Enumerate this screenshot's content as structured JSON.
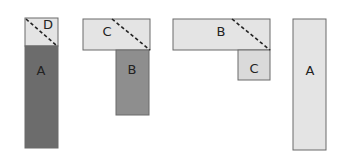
{
  "colors": {
    "light": "#e4e4e4",
    "light_c": "#dadada",
    "medium": "#8e8e8e",
    "dark": "#6c6c6c",
    "stroke": "#6a6a6a",
    "dash": "#222222"
  },
  "figures": [
    {
      "id": "fig1",
      "pieces": [
        {
          "label": "D",
          "x": 25,
          "y": 18,
          "w": 33,
          "h": 28,
          "fill": "#e4e4e4",
          "lx": 48,
          "ly": 25
        },
        {
          "label": "A",
          "x": 25,
          "y": 46,
          "w": 33,
          "h": 102,
          "fill": "#6c6c6c",
          "lx": 41,
          "ly": 71
        }
      ],
      "dash": {
        "x1": 26,
        "y1": 19,
        "x2": 56,
        "y2": 45
      }
    },
    {
      "id": "fig2",
      "pieces": [
        {
          "label": "C",
          "x": 83,
          "y": 19,
          "w": 67,
          "h": 31,
          "fill": "#e4e4e4",
          "lx": 107,
          "ly": 32
        },
        {
          "label": "B",
          "x": 116,
          "y": 50,
          "w": 33,
          "h": 65,
          "fill": "#8e8e8e",
          "lx": 132,
          "ly": 70
        }
      ],
      "dash": {
        "x1": 112,
        "y1": 19,
        "x2": 150,
        "y2": 50
      }
    },
    {
      "id": "fig3",
      "pieces": [
        {
          "label": "B",
          "x": 173,
          "y": 19,
          "w": 97,
          "h": 31,
          "fill": "#e4e4e4",
          "lx": 221,
          "ly": 32
        },
        {
          "label": "C",
          "x": 238,
          "y": 50,
          "w": 32,
          "h": 30,
          "fill": "#dadada",
          "lx": 254,
          "ly": 69
        }
      ],
      "dash": {
        "x1": 232,
        "y1": 19,
        "x2": 270,
        "y2": 50
      }
    },
    {
      "id": "fig4",
      "pieces": [
        {
          "label": "A",
          "x": 293,
          "y": 19,
          "w": 33,
          "h": 131,
          "fill": "#e4e4e4",
          "lx": 310,
          "ly": 71
        }
      ],
      "dash": null
    }
  ]
}
